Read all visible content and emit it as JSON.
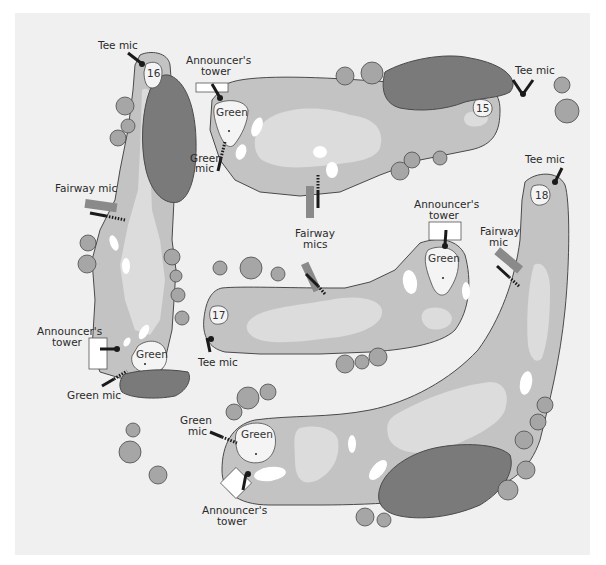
{
  "diagram": {
    "colors": {
      "background": "#f1f1f1",
      "frame_edge": "#e9e9e9",
      "rough": "#c3c3c3",
      "fairway": "#dcdcdc",
      "green": "#f4f4f4",
      "bunker": "#ffffff",
      "water": "#7a7a7a",
      "tree": "#a6a6a6",
      "outline": "#4a4a4a",
      "mic": "#1a1a1a",
      "fairway_mic_stand": "#8a8a8a"
    },
    "holes": [
      {
        "number": "15",
        "tee_label": "Tee mic",
        "green_label": "Green",
        "tower_label_1": "Announcer's",
        "tower_label_2": "tower",
        "green_mic_1": "Green",
        "green_mic_2": "mic",
        "fairway_mics_1": "Fairway",
        "fairway_mics_2": "mics"
      },
      {
        "number": "16",
        "tee_label": "Tee mic",
        "green_label": "Green",
        "tower_label_1": "Announcer's",
        "tower_label_2": "tower",
        "green_mic": "Green mic",
        "fairway_mic": "Fairway mic"
      },
      {
        "number": "17",
        "tee_label": "Tee mic",
        "green_label": "Green",
        "tower_label_1": "Announcer's",
        "tower_label_2": "tower",
        "fairway_mics_1": "Fairway",
        "fairway_mics_2": "mics"
      },
      {
        "number": "18",
        "tee_label": "Tee mic",
        "green_label": "Green",
        "tower_label_1": "Announcer's",
        "tower_label_2": "tower",
        "green_mic_1": "Green",
        "green_mic_2": "mic",
        "fairway_mic_1": "Fairway",
        "fairway_mic_2": "mic"
      }
    ]
  }
}
